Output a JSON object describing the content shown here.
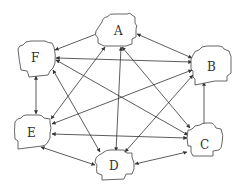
{
  "diagram": {
    "type": "fully-connected network of cloud-shaped nodes with bidirectional arrows",
    "nodes": [
      {
        "id": "A",
        "label": "A",
        "cx": 118,
        "cy": 30
      },
      {
        "id": "B",
        "label": "B",
        "cx": 212,
        "cy": 67
      },
      {
        "id": "C",
        "label": "C",
        "cx": 205,
        "cy": 145
      },
      {
        "id": "D",
        "label": "D",
        "cx": 114,
        "cy": 166
      },
      {
        "id": "E",
        "label": "E",
        "cx": 32,
        "cy": 132
      },
      {
        "id": "F",
        "label": "F",
        "cx": 36,
        "cy": 59
      }
    ],
    "edges": [
      {
        "from": "A",
        "to": "F",
        "bidirectional": true
      },
      {
        "from": "A",
        "to": "B",
        "bidirectional": true
      },
      {
        "from": "A",
        "to": "C",
        "bidirectional": true
      },
      {
        "from": "A",
        "to": "D",
        "bidirectional": true
      },
      {
        "from": "A",
        "to": "E",
        "bidirectional": true
      },
      {
        "from": "F",
        "to": "B",
        "bidirectional": true
      },
      {
        "from": "F",
        "to": "C",
        "bidirectional": true
      },
      {
        "from": "F",
        "to": "D",
        "bidirectional": true
      },
      {
        "from": "F",
        "to": "E",
        "bidirectional": true
      },
      {
        "from": "B",
        "to": "C",
        "bidirectional": true
      },
      {
        "from": "B",
        "to": "D",
        "bidirectional": true
      },
      {
        "from": "B",
        "to": "E",
        "bidirectional": true
      },
      {
        "from": "C",
        "to": "D",
        "bidirectional": true
      },
      {
        "from": "C",
        "to": "E",
        "bidirectional": true
      },
      {
        "from": "D",
        "to": "E",
        "bidirectional": true
      }
    ],
    "colors": {
      "line": "#333333",
      "node_stroke": "#555555",
      "background": "#ffffff"
    }
  }
}
